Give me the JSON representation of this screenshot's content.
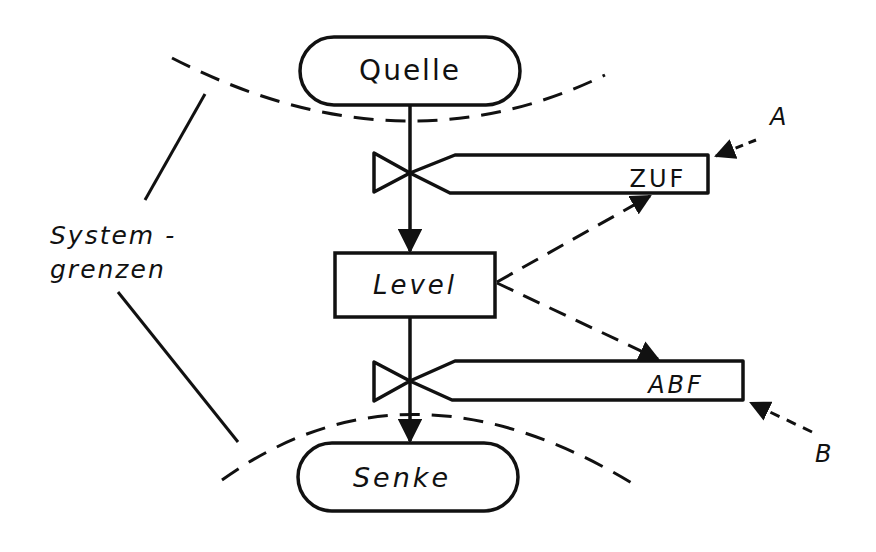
{
  "diagram": {
    "nodes": {
      "source": {
        "label": "Quelle",
        "shape": "pill"
      },
      "level": {
        "label": "Level",
        "shape": "rectangle"
      },
      "sink": {
        "label": "Senke",
        "shape": "pill"
      }
    },
    "valves": {
      "inflow": {
        "label": "ZUF",
        "icon": "valve-icon"
      },
      "outflow": {
        "label": "ABF",
        "icon": "valve-icon"
      }
    },
    "external_inputs": {
      "a": {
        "label": "A"
      },
      "b": {
        "label": "B"
      }
    },
    "annotation": {
      "line1": "System -",
      "line2": "grenzen"
    },
    "colors": {
      "ink": "#111111",
      "background": "#ffffff"
    }
  }
}
